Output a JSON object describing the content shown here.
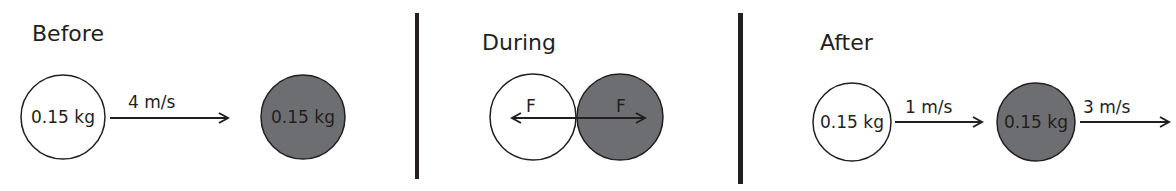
{
  "colors": {
    "ink": "#231f20",
    "ball_white": "#ffffff",
    "ball_gray": "#6d6e71"
  },
  "panels": {
    "before": {
      "title": "Before",
      "ball_a": {
        "mass": "0.15 kg",
        "fill": "white"
      },
      "ball_b": {
        "mass": "0.15 kg",
        "fill": "gray"
      },
      "velocity_a": "4 m/s"
    },
    "during": {
      "title": "During",
      "force_left": "F",
      "force_right": "F"
    },
    "after": {
      "title": "After",
      "ball_a": {
        "mass": "0.15 kg",
        "fill": "white"
      },
      "ball_b": {
        "mass": "0.15 kg",
        "fill": "gray"
      },
      "velocity_a": "1 m/s",
      "velocity_b": "3 m/s"
    }
  }
}
